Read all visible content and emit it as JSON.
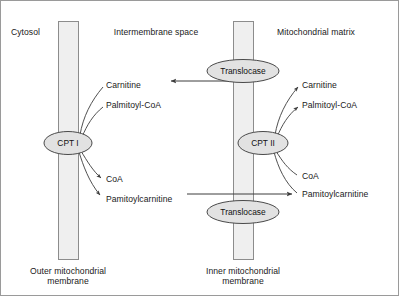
{
  "diagram": {
    "regions": [
      {
        "name": "cytosol",
        "label": "Cytosol"
      },
      {
        "name": "intermembrane-space",
        "label": "Intermembrane space"
      },
      {
        "name": "mitochondrial-matrix",
        "label": "Mitochondrial matrix"
      }
    ],
    "membranes": [
      {
        "name": "outer-mitochondrial-membrane",
        "caption_line1": "Outer mitochondrial",
        "caption_line2": "membrane"
      },
      {
        "name": "inner-mitochondrial-membrane",
        "caption_line1": "Inner mitochondrial",
        "caption_line2": "membrane"
      }
    ],
    "enzymes": [
      {
        "name": "cpt-i",
        "label": "CPT I"
      },
      {
        "name": "cpt-ii",
        "label": "CPT II"
      }
    ],
    "transporters": [
      {
        "name": "translocase-upper",
        "label": "Translocase"
      },
      {
        "name": "translocase-lower",
        "label": "Translocase"
      }
    ],
    "metabolites": {
      "cpt_i_substrates": [
        {
          "name": "carnitine-cytosolic",
          "label": "Carnitine"
        },
        {
          "name": "palmitoyl-coa-cytosolic",
          "label": "Palmitoyl-CoA"
        }
      ],
      "cpt_i_products": [
        {
          "name": "coa-cytosolic",
          "label": "CoA"
        },
        {
          "name": "palmitoylcarnitine-cytosolic",
          "label": "Pamitoylcarnitine"
        }
      ],
      "cpt_ii_products": [
        {
          "name": "carnitine-matrix",
          "label": "Carnitine"
        },
        {
          "name": "palmitoyl-coa-matrix",
          "label": "Palmitoyl-CoA"
        }
      ],
      "cpt_ii_substrates": [
        {
          "name": "coa-matrix",
          "label": "CoA"
        },
        {
          "name": "palmitoylcarnitine-matrix",
          "label": "Pamitoylcarnitine"
        }
      ]
    },
    "transport_arrows": [
      {
        "name": "carnitine-export-arrow",
        "direction": "left"
      },
      {
        "name": "palmitoylcarnitine-import-arrow",
        "direction": "right"
      }
    ],
    "colors": {
      "frame_border": "#9a9a9a",
      "membrane_fill": "#efefef",
      "membrane_stroke": "#8c8c8c",
      "ellipse_fill": "#e2e2e2",
      "ellipse_stroke": "#4a4a4a",
      "line_stroke": "#3c3c3c",
      "text": "#1a1a1a",
      "background": "#ffffff"
    }
  }
}
